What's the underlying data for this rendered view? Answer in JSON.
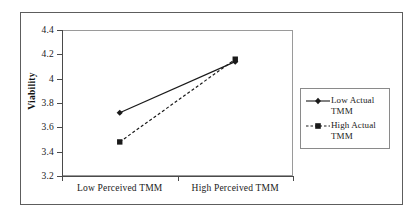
{
  "chart_data": {
    "type": "line",
    "title": "",
    "xlabel": "",
    "ylabel": "Viability",
    "categories": [
      "Low Perceived TMM",
      "High Perceived TMM"
    ],
    "ylim": [
      3.2,
      4.4
    ],
    "yticks": [
      "4.4",
      "4.2",
      "4",
      "3.8",
      "3.6",
      "3.4",
      "3.2"
    ],
    "ytick_values": [
      4.4,
      4.2,
      4.0,
      3.8,
      3.6,
      3.4,
      3.2
    ],
    "grid": false,
    "legend_position": "right",
    "series": [
      {
        "name": "Low Actual TMM",
        "values": [
          3.72,
          4.14
        ],
        "line_style": "solid",
        "marker": "diamond",
        "color": "#1a1a1a"
      },
      {
        "name": "High Actual TMM",
        "values": [
          3.48,
          4.16
        ],
        "line_style": "dashed",
        "marker": "square",
        "color": "#1a1a1a"
      }
    ]
  },
  "legend": {
    "items": [
      {
        "label_line1": "Low Actual",
        "label_line2": "TMM"
      },
      {
        "label_line1": "High Actual",
        "label_line2": "TMM"
      }
    ]
  },
  "colors": {
    "series_line": "#1a1a1a",
    "axis": "#4a4a4a",
    "plot_border": "#9a9a9a",
    "outer_frame": "#5d5d5d",
    "background": "#ffffff"
  }
}
